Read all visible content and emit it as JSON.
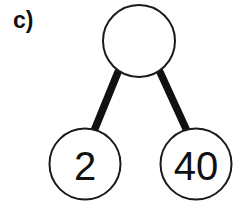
{
  "figure": {
    "part_label": "c)",
    "type": "number-bond",
    "background_color": "#ffffff",
    "stroke_color": "#1a1a1a",
    "connector_color": "#111111",
    "text_color": "#111111"
  },
  "nodes": {
    "whole": {
      "label": "",
      "name": "whole",
      "cx": 139,
      "cy": 41,
      "r": 36,
      "filled": false
    },
    "part_left": {
      "label": "2",
      "name": "part-left",
      "cx": 85,
      "cy": 164,
      "r": 35.5,
      "filled": false
    },
    "part_right": {
      "label": "40",
      "name": "part-right",
      "cx": 196,
      "cy": 164,
      "r": 35.5,
      "filled": false
    }
  },
  "connectors": [
    {
      "name": "whole-to-left",
      "x1": 118,
      "y1": 72,
      "x2": 94,
      "y2": 131
    },
    {
      "name": "whole-to-right",
      "x1": 160,
      "y1": 72,
      "x2": 187,
      "y2": 131
    }
  ]
}
